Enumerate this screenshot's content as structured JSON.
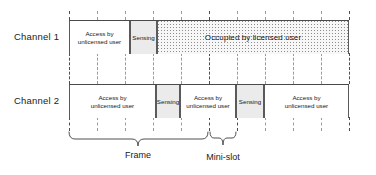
{
  "diagram": {
    "title_hidden": "",
    "rows": [
      {
        "label": "Channel 1",
        "blocks": [
          {
            "type": "access",
            "text": "Access by unlicensed user",
            "line1": "Access by",
            "line2": "unlicensed user"
          },
          {
            "type": "sensing",
            "text": "Sensing",
            "line1": "Sensing",
            "line2": ""
          },
          {
            "type": "occupied",
            "text": "Occupied by licensed user",
            "line1": "Occupied by licensed user",
            "line2": ""
          }
        ]
      },
      {
        "label": "Channel 2",
        "blocks": [
          {
            "type": "access",
            "text": "Access by unlicensed user",
            "line1": "Access by",
            "line2": "unlicensed user"
          },
          {
            "type": "sensing",
            "text": "Sensing",
            "line1": "Sensing",
            "line2": ""
          },
          {
            "type": "access",
            "text": "Access by unlicensed user",
            "line1": "Access by",
            "line2": "unlicensed user"
          },
          {
            "type": "sensing",
            "text": "Sensing",
            "line1": "Sensing",
            "line2": ""
          },
          {
            "type": "access",
            "text": "Access by unlicensed user",
            "line1": "Access by",
            "line2": "unlicensed user"
          }
        ]
      }
    ],
    "braces": [
      {
        "name": "frame",
        "label": "Frame"
      },
      {
        "name": "mini-slot",
        "label": "Mini-slot"
      }
    ],
    "colors": {
      "line": "#4a4a4a",
      "block_border": "#5a5a5a",
      "sensing_fill": "#ebebeb",
      "occupied_dot": "#8d8d8d",
      "guide": "#9a9a9a",
      "text": "#161616",
      "background": "#ffffff"
    }
  }
}
